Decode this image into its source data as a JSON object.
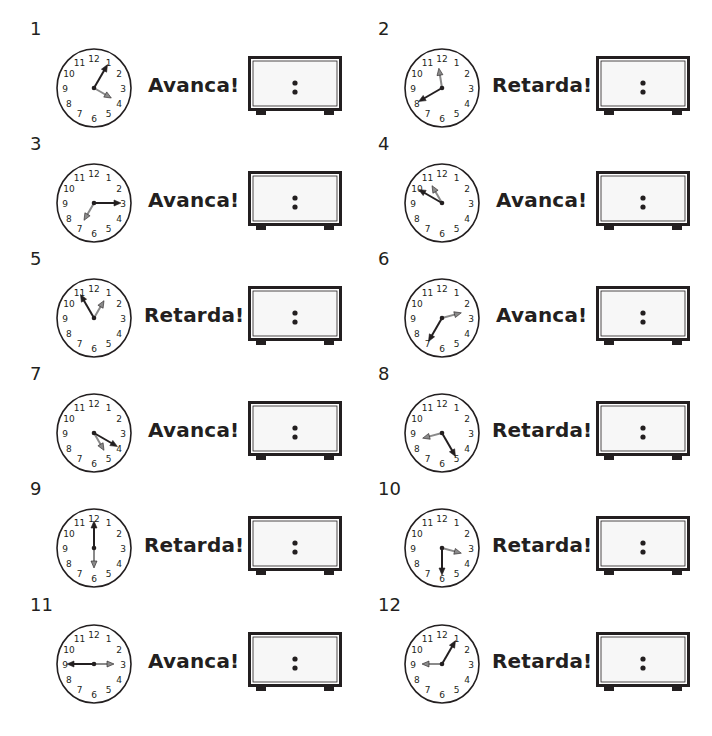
{
  "items": [
    {
      "number": "1",
      "label": "Avanca!",
      "display": ":",
      "dark_hand_hour": 1,
      "gray_hand_hour": 4
    },
    {
      "number": "2",
      "label": "Retarda!",
      "display": ":",
      "dark_hand_hour": 8,
      "gray_hand_hour": 11.7
    },
    {
      "number": "3",
      "label": "Avanca!",
      "display": ":",
      "dark_hand_hour": 3,
      "gray_hand_hour": 7
    },
    {
      "number": "4",
      "label": "Avanca!",
      "display": ":",
      "dark_hand_hour": 10,
      "gray_hand_hour": 11
    },
    {
      "number": "5",
      "label": "Retarda!",
      "display": ":",
      "dark_hand_hour": 11,
      "gray_hand_hour": 1
    },
    {
      "number": "6",
      "label": "Avanca!",
      "display": ":",
      "dark_hand_hour": 7,
      "gray_hand_hour": 2.5
    },
    {
      "number": "7",
      "label": "Avanca!",
      "display": ":",
      "dark_hand_hour": 4,
      "gray_hand_hour": 5
    },
    {
      "number": "8",
      "label": "Retarda!",
      "display": ":",
      "dark_hand_hour": 5,
      "gray_hand_hour": 8.5
    },
    {
      "number": "9",
      "label": "Retarda!",
      "display": ":",
      "dark_hand_hour": 12,
      "gray_hand_hour": 6
    },
    {
      "number": "10",
      "label": "Retarda!",
      "display": ":",
      "dark_hand_hour": 6,
      "gray_hand_hour": 3.5
    },
    {
      "number": "11",
      "label": "Avanca!",
      "display": ":",
      "dark_hand_hour": 9,
      "gray_hand_hour": 3
    },
    {
      "number": "12",
      "label": "Retarda!",
      "display": ":",
      "dark_hand_hour": 1,
      "gray_hand_hour": 9
    }
  ],
  "clock_numerals": [
    "12",
    "1",
    "2",
    "3",
    "4",
    "5",
    "6",
    "7",
    "8",
    "9",
    "10",
    "11"
  ],
  "colors": {
    "ink": "#231f20",
    "gray_hand": "#8a8a8a",
    "dark_hand": "#231f20",
    "box_inner": "#f7f7f7"
  }
}
